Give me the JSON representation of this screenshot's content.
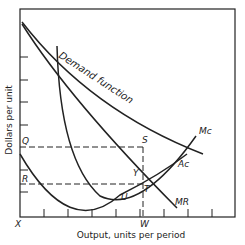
{
  "diagram": {
    "type": "monopoly price-output diagram",
    "ylabel": "Dollars per unit",
    "xlabel": "Output,  units per period",
    "origin_label": "X",
    "curves": {
      "demand": "Demand function",
      "marginal_cost": "Mc",
      "average_cost": "Ac",
      "marginal_revenue": "MR"
    },
    "points": {
      "S": "S",
      "Y": "Y",
      "T": "T",
      "U": "U"
    },
    "y_levels": {
      "Q": "Q",
      "R": "R"
    },
    "x_levels": {
      "W": "W"
    },
    "colors": {
      "ink": "#222222",
      "background": "#ffffff"
    }
  }
}
